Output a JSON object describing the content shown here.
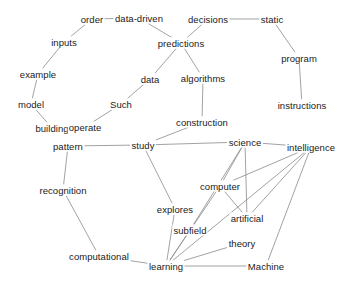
{
  "graph": {
    "title": "Concept Network Graph",
    "background_color": "#ffffff",
    "edge_color": "#8a8a8a",
    "label_color": "#1a1a1a",
    "width": 351,
    "height": 287
  },
  "chart_data": {
    "type": "network",
    "title": "",
    "xlabel": "",
    "ylabel": "",
    "grid": false,
    "legend": false,
    "layout": "force-directed",
    "node_count": 30,
    "edge_count": 36,
    "nodes": [
      {
        "id": "order",
        "label": "order",
        "x": 92,
        "y": 19
      },
      {
        "id": "data-driven",
        "label": "data-driven",
        "x": 139,
        "y": 18
      },
      {
        "id": "decisions",
        "label": "decisions",
        "x": 208,
        "y": 19
      },
      {
        "id": "static",
        "label": "static",
        "x": 272,
        "y": 19
      },
      {
        "id": "inputs",
        "label": "inputs",
        "x": 64,
        "y": 42
      },
      {
        "id": "predictions",
        "label": "predictions",
        "x": 181,
        "y": 43
      },
      {
        "id": "program",
        "label": "program",
        "x": 299,
        "y": 58
      },
      {
        "id": "example",
        "label": "example",
        "x": 38,
        "y": 74
      },
      {
        "id": "data",
        "label": "data",
        "x": 150,
        "y": 79
      },
      {
        "id": "algorithms",
        "label": "algorithms",
        "x": 203,
        "y": 78
      },
      {
        "id": "model",
        "label": "model",
        "x": 31,
        "y": 104
      },
      {
        "id": "Such",
        "label": "Such",
        "x": 121,
        "y": 104
      },
      {
        "id": "instructions",
        "label": "instructions",
        "x": 302,
        "y": 105
      },
      {
        "id": "building",
        "label": "building",
        "x": 52,
        "y": 128
      },
      {
        "id": "operate",
        "label": "operate",
        "x": 85,
        "y": 127
      },
      {
        "id": "construction",
        "label": "construction",
        "x": 202,
        "y": 122
      },
      {
        "id": "pattern",
        "label": "pattern",
        "x": 68,
        "y": 146
      },
      {
        "id": "study",
        "label": "study",
        "x": 143,
        "y": 145
      },
      {
        "id": "science",
        "label": "science",
        "x": 245,
        "y": 142
      },
      {
        "id": "intelligence",
        "label": "intelligence",
        "x": 311,
        "y": 147
      },
      {
        "id": "recognition",
        "label": "recognition",
        "x": 63,
        "y": 190
      },
      {
        "id": "computer",
        "label": "computer",
        "x": 220,
        "y": 186
      },
      {
        "id": "explores",
        "label": "explores",
        "x": 175,
        "y": 209
      },
      {
        "id": "artificial",
        "label": "artificial",
        "x": 247,
        "y": 218
      },
      {
        "id": "subfield",
        "label": "subfield",
        "x": 190,
        "y": 230
      },
      {
        "id": "theory",
        "label": "theory",
        "x": 242,
        "y": 243
      },
      {
        "id": "computational",
        "label": "computational",
        "x": 99,
        "y": 256
      },
      {
        "id": "learning",
        "label": "learning",
        "x": 166,
        "y": 266
      },
      {
        "id": "Machine",
        "label": "Machine",
        "x": 266,
        "y": 266
      }
    ],
    "edges": [
      {
        "source": "order",
        "target": "data-driven"
      },
      {
        "source": "order",
        "target": "inputs"
      },
      {
        "source": "inputs",
        "target": "example"
      },
      {
        "source": "example",
        "target": "model"
      },
      {
        "source": "model",
        "target": "building"
      },
      {
        "source": "data-driven",
        "target": "predictions"
      },
      {
        "source": "decisions",
        "target": "predictions"
      },
      {
        "source": "decisions",
        "target": "static"
      },
      {
        "source": "static",
        "target": "program"
      },
      {
        "source": "program",
        "target": "instructions"
      },
      {
        "source": "predictions",
        "target": "data"
      },
      {
        "source": "predictions",
        "target": "algorithms"
      },
      {
        "source": "data",
        "target": "Such"
      },
      {
        "source": "Such",
        "target": "operate"
      },
      {
        "source": "algorithms",
        "target": "construction"
      },
      {
        "source": "construction",
        "target": "study"
      },
      {
        "source": "pattern",
        "target": "study"
      },
      {
        "source": "pattern",
        "target": "recognition"
      },
      {
        "source": "recognition",
        "target": "computational"
      },
      {
        "source": "computational",
        "target": "learning"
      },
      {
        "source": "study",
        "target": "science"
      },
      {
        "source": "study",
        "target": "explores"
      },
      {
        "source": "explores",
        "target": "learning"
      },
      {
        "source": "science",
        "target": "computer"
      },
      {
        "source": "science",
        "target": "artificial"
      },
      {
        "source": "science",
        "target": "intelligence"
      },
      {
        "source": "computer",
        "target": "artificial"
      },
      {
        "source": "computer",
        "target": "learning"
      },
      {
        "source": "computer",
        "target": "intelligence"
      },
      {
        "source": "subfield",
        "target": "learning"
      },
      {
        "source": "subfield",
        "target": "science"
      },
      {
        "source": "artificial",
        "target": "intelligence"
      },
      {
        "source": "theory",
        "target": "learning"
      },
      {
        "source": "learning",
        "target": "Machine"
      },
      {
        "source": "learning",
        "target": "intelligence"
      },
      {
        "source": "Machine",
        "target": "intelligence"
      }
    ]
  }
}
